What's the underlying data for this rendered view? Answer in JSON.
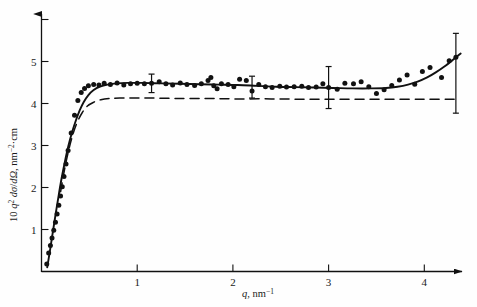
{
  "chart_data": {
    "type": "scatter",
    "title": "",
    "subtitle": "",
    "xlabel": "q, nm⁻¹",
    "xlabel_parts": {
      "symbol": "q",
      "sep": ", ",
      "unit": "nm",
      "unit_exp": "−1"
    },
    "ylabel": "10 q² dσ/dΩ, nm⁻²·cm",
    "ylabel_parts": {
      "prefix": "10 ",
      "sym1": "q",
      "sym1_exp": "2",
      "mid": " dσ/dΩ, nm",
      "unit_exp": "−2",
      "suffix": "·cm"
    },
    "xlim": [
      0,
      4.55
    ],
    "ylim": [
      0,
      6.55
    ],
    "xticks": [
      1,
      2,
      3,
      4
    ],
    "xtick_labels": [
      "1",
      "2",
      "3",
      "4"
    ],
    "yticks": [
      1,
      2,
      3,
      4,
      5,
      6
    ],
    "ytick_labels": [
      "1",
      "2",
      "3",
      "4",
      "5",
      ""
    ],
    "grid": false,
    "legend": "none",
    "axis_style": "arrow-tipped left and bottom spines",
    "marker": "filled-circle",
    "marker_color": "#111111",
    "points": [
      [
        0.055,
        0.18
      ],
      [
        0.075,
        0.44
      ],
      [
        0.093,
        0.62
      ],
      [
        0.11,
        0.8
      ],
      [
        0.128,
        0.98
      ],
      [
        0.146,
        1.17
      ],
      [
        0.163,
        1.37
      ],
      [
        0.181,
        1.58
      ],
      [
        0.199,
        1.8
      ],
      [
        0.217,
        2.02
      ],
      [
        0.235,
        2.26
      ],
      [
        0.256,
        2.56
      ],
      [
        0.278,
        2.88
      ],
      [
        0.31,
        3.3
      ],
      [
        0.345,
        3.72
      ],
      [
        0.38,
        4.07
      ],
      [
        0.415,
        4.26
      ],
      [
        0.45,
        4.36
      ],
      [
        0.49,
        4.42
      ],
      [
        0.545,
        4.45
      ],
      [
        0.6,
        4.44
      ],
      [
        0.655,
        4.48
      ],
      [
        0.72,
        4.45
      ],
      [
        0.79,
        4.49
      ],
      [
        0.86,
        4.44
      ],
      [
        0.93,
        4.47
      ],
      [
        1.0,
        4.48
      ],
      [
        1.075,
        4.47
      ],
      [
        1.15,
        4.48
      ],
      [
        1.23,
        4.52
      ],
      [
        1.3,
        4.47
      ],
      [
        1.37,
        4.44
      ],
      [
        1.45,
        4.49
      ],
      [
        1.52,
        4.45
      ],
      [
        1.6,
        4.43
      ],
      [
        1.67,
        4.47
      ],
      [
        1.74,
        4.55
      ],
      [
        1.77,
        4.62
      ],
      [
        1.8,
        4.42
      ],
      [
        1.835,
        4.35
      ],
      [
        1.88,
        4.47
      ],
      [
        1.95,
        4.45
      ],
      [
        2.01,
        4.4
      ],
      [
        2.07,
        4.58
      ],
      [
        2.14,
        4.55
      ],
      [
        2.2,
        4.3
      ],
      [
        2.27,
        4.45
      ],
      [
        2.34,
        4.4
      ],
      [
        2.41,
        4.38
      ],
      [
        2.49,
        4.41
      ],
      [
        2.56,
        4.39
      ],
      [
        2.64,
        4.4
      ],
      [
        2.72,
        4.41
      ],
      [
        2.79,
        4.38
      ],
      [
        2.87,
        4.39
      ],
      [
        2.94,
        4.47
      ],
      [
        3.0,
        4.38
      ],
      [
        3.09,
        4.34
      ],
      [
        3.17,
        4.48
      ],
      [
        3.26,
        4.47
      ],
      [
        3.34,
        4.52
      ],
      [
        3.42,
        4.4
      ],
      [
        3.5,
        4.24
      ],
      [
        3.58,
        4.33
      ],
      [
        3.66,
        4.43
      ],
      [
        3.74,
        4.56
      ],
      [
        3.82,
        4.68
      ],
      [
        3.9,
        4.46
      ],
      [
        3.98,
        4.76
      ],
      [
        4.06,
        4.86
      ],
      [
        4.18,
        4.62
      ],
      [
        4.26,
        5.02
      ],
      [
        4.33,
        5.1
      ]
    ],
    "curves": [
      {
        "name": "solid-fit-curve",
        "style": "solid",
        "color": "#111111",
        "points": [
          [
            0.06,
            0.1
          ],
          [
            0.09,
            0.52
          ],
          [
            0.12,
            0.96
          ],
          [
            0.15,
            1.4
          ],
          [
            0.18,
            1.82
          ],
          [
            0.21,
            2.22
          ],
          [
            0.245,
            2.62
          ],
          [
            0.28,
            2.98
          ],
          [
            0.32,
            3.32
          ],
          [
            0.36,
            3.6
          ],
          [
            0.4,
            3.84
          ],
          [
            0.44,
            4.03
          ],
          [
            0.49,
            4.2
          ],
          [
            0.545,
            4.32
          ],
          [
            0.61,
            4.4
          ],
          [
            0.69,
            4.45
          ],
          [
            0.79,
            4.48
          ],
          [
            0.9,
            4.49
          ],
          [
            1.05,
            4.49
          ],
          [
            1.25,
            4.48
          ],
          [
            1.45,
            4.47
          ],
          [
            1.65,
            4.46
          ],
          [
            1.85,
            4.45
          ],
          [
            2.05,
            4.44
          ],
          [
            2.25,
            4.42
          ],
          [
            2.45,
            4.4
          ],
          [
            2.65,
            4.39
          ],
          [
            2.85,
            4.38
          ],
          [
            3.05,
            4.37
          ],
          [
            3.25,
            4.36
          ],
          [
            3.45,
            4.36
          ],
          [
            3.6,
            4.37
          ],
          [
            3.72,
            4.4
          ],
          [
            3.83,
            4.45
          ],
          [
            3.93,
            4.52
          ],
          [
            4.03,
            4.62
          ],
          [
            4.12,
            4.74
          ],
          [
            4.21,
            4.88
          ],
          [
            4.3,
            5.04
          ],
          [
            4.38,
            5.19
          ]
        ]
      },
      {
        "name": "dashed-reference-curve",
        "style": "dashed",
        "color": "#111111",
        "points": [
          [
            0.2,
            1.9
          ],
          [
            0.24,
            2.42
          ],
          [
            0.285,
            2.9
          ],
          [
            0.33,
            3.28
          ],
          [
            0.375,
            3.56
          ],
          [
            0.425,
            3.78
          ],
          [
            0.48,
            3.94
          ],
          [
            0.545,
            4.03
          ],
          [
            0.62,
            4.09
          ],
          [
            0.71,
            4.12
          ],
          [
            0.82,
            4.13
          ],
          [
            0.96,
            4.13
          ],
          [
            1.15,
            4.13
          ],
          [
            1.4,
            4.12
          ],
          [
            1.7,
            4.12
          ],
          [
            2.0,
            4.11
          ],
          [
            2.4,
            4.11
          ],
          [
            2.8,
            4.1
          ],
          [
            3.2,
            4.1
          ],
          [
            3.6,
            4.1
          ],
          [
            4.0,
            4.1
          ],
          [
            4.33,
            4.1
          ]
        ]
      }
    ],
    "error_bars": [
      {
        "x": 1.15,
        "y": 4.48,
        "minus": 0.22,
        "plus": 0.22,
        "cap": 6
      },
      {
        "x": 2.2,
        "y": 4.39,
        "minus": 0.26,
        "plus": 0.26,
        "cap": 6
      },
      {
        "x": 3.0,
        "y": 4.38,
        "minus": 0.5,
        "plus": 0.5,
        "cap": 6
      },
      {
        "x": 4.33,
        "y": 4.72,
        "minus": 0.95,
        "plus": 0.95,
        "cap": 6
      }
    ]
  }
}
